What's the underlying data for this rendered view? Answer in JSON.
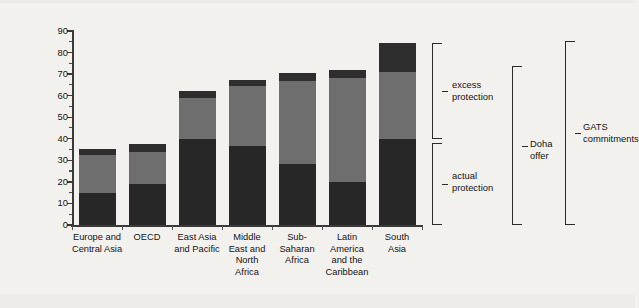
{
  "chart_data": {
    "type": "bar",
    "title": "",
    "subtitle": "",
    "xlabel": "",
    "ylabel": "services trade restrictiveness index",
    "ylim": [
      0,
      90
    ],
    "ytick_step": 10,
    "yminor_step": 5,
    "grid": false,
    "legend_position": "right-brackets",
    "stacked": true,
    "categories": [
      "Europe and\nCentral Asia",
      "OECD",
      "East Asia\nand Pacific",
      "Middle\nEast and\nNorth\nAfrica",
      "Sub-\nSaharan\nAfrica",
      "Latin\nAmerica\nand the\nCaribbean",
      "South\nAsia"
    ],
    "ticklabels": [
      "0",
      "10",
      "20",
      "30",
      "40",
      "50",
      "60",
      "70",
      "80",
      "90"
    ],
    "series": [
      {
        "name": "actual protection",
        "color": "#272727",
        "values": [
          14.8,
          19.0,
          40.0,
          36.6,
          28.3,
          20.0,
          40.0
        ]
      },
      {
        "name": "excess protection",
        "color": "#6e6e6e",
        "values": [
          17.7,
          15.0,
          19.0,
          27.9,
          38.7,
          48.0,
          31.0
        ]
      },
      {
        "name": "Doha offer cap",
        "color": "#2e2e2e",
        "values": [
          2.8,
          3.5,
          3.0,
          2.8,
          3.5,
          4.0,
          13.5
        ]
      }
    ],
    "totals": [
      35.3,
      37.5,
      62.0,
      67.3,
      70.5,
      72.0,
      84.5
    ],
    "annotations": [
      {
        "id": "excess-protection",
        "label": "excess\nprotection"
      },
      {
        "id": "actual-protection",
        "label": "actual\nprotection"
      },
      {
        "id": "doha-offer",
        "label": "Doha\noffer"
      },
      {
        "id": "gats-commitments",
        "label": "GATS\ncommitments"
      }
    ]
  },
  "annotations": {
    "excess_protection_line1": "excess",
    "excess_protection_line2": "protection",
    "actual_protection_line1": "actual",
    "actual_protection_line2": "protection",
    "doha_offer_line1": "Doha",
    "doha_offer_line2": "offer",
    "gats_line1": "GATS",
    "gats_line2": "commitments"
  },
  "axis": {
    "y_title": "services trade restrictiveness index",
    "y_ticks": [
      "90",
      "80",
      "70",
      "60",
      "50",
      "40",
      "30",
      "20",
      "10",
      "0"
    ]
  },
  "categories": [
    {
      "l1": "Europe and",
      "l2": "Central Asia",
      "l3": "",
      "l4": ""
    },
    {
      "l1": "OECD",
      "l2": "",
      "l3": "",
      "l4": ""
    },
    {
      "l1": "East Asia",
      "l2": "and Pacific",
      "l3": "",
      "l4": ""
    },
    {
      "l1": "Middle",
      "l2": "East and",
      "l3": "North",
      "l4": "Africa"
    },
    {
      "l1": "Sub-",
      "l2": "Saharan",
      "l3": "Africa",
      "l4": ""
    },
    {
      "l1": "Latin",
      "l2": "America",
      "l3": "and the",
      "l4": "Caribbean"
    },
    {
      "l1": "South",
      "l2": "Asia",
      "l3": "",
      "l4": ""
    }
  ]
}
